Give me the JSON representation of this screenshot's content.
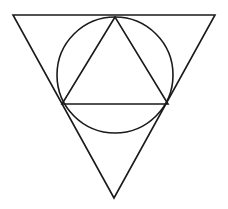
{
  "figure": {
    "title": "Inverted triangle with inscribed circle and inscribed upright triangle",
    "background_color": "#ffffff",
    "stroke_color": "#1a1a1a",
    "stroke_width": 1.6,
    "canvas": {
      "width": 228,
      "height": 209
    },
    "shapes": [
      {
        "name": "outer-triangle",
        "type": "polygon",
        "orientation": "pointing-down",
        "points": "13,15 215,15 114,198",
        "vertices": [
          {
            "label": "top-left",
            "x": 13,
            "y": 15
          },
          {
            "label": "top-right",
            "x": 215,
            "y": 15
          },
          {
            "label": "bottom-apex",
            "x": 114,
            "y": 198
          }
        ]
      },
      {
        "name": "inscribed-circle",
        "type": "circle",
        "cx": 115,
        "cy": 75,
        "r": 58,
        "extents": {
          "left_x": 57,
          "right_x": 173,
          "top_y": 17,
          "bottom_y": 133
        }
      },
      {
        "name": "inner-triangle",
        "type": "polygon",
        "orientation": "pointing-up",
        "points": "115,17 62,104 168,104",
        "vertices": [
          {
            "label": "top-apex",
            "x": 115,
            "y": 17
          },
          {
            "label": "bottom-left",
            "x": 62,
            "y": 104
          },
          {
            "label": "bottom-right",
            "x": 168,
            "y": 104
          }
        ]
      }
    ]
  }
}
